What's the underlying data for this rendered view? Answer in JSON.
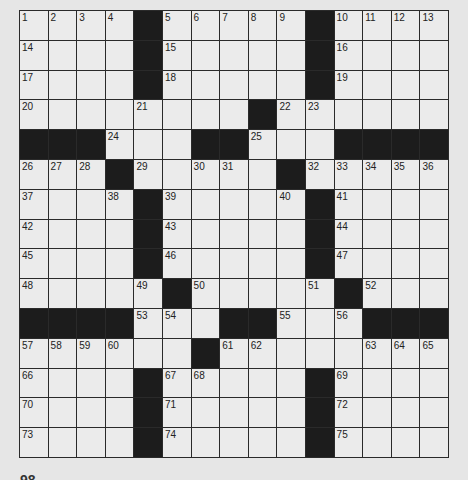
{
  "puzzle": {
    "rows": 15,
    "cols": 15,
    "colors": {
      "background": "#e6e6e6",
      "cell": "#ebebeb",
      "block": "#1c1c1c",
      "gridline": "#2a2a2a"
    },
    "layout": [
      "1.2.3.4.#.5.6.7.8.9.#.10.11.12.13",
      "14.o.o.o.#.15.o.o.o.o.#.16.o.o.o",
      "17.o.o.o.#.18.o.o.o.o.#.19.o.o.o",
      "20.o.o.o.21.o.o.o.#.22.23.o.o.o.o",
      "#.#.#.24.o.o.#.#.25.o.o.#.#.#.#",
      "26.27.28.#.29.o.30.31.o.#.32.33.34.35.36",
      "37.o.o.38.#.39.o.o.o.40.#.41.o.o.o",
      "42.o.o.o.#.43.o.o.o.o.#.44.o.o.o",
      "45.o.o.o.#.46.o.o.o.o.#.47.o.o.o",
      "48.o.o.o.49.#.50.o.o.o.51.#.52.o.o",
      "#.#.#.#.53.54.o.#.#.55.o.56.#.#.#",
      "57.58.59.60.o.o.#.61.62.o.o.o.63.64.65",
      "66.o.o.o.#.67.68.o.o.o.#.69.o.o.o",
      "70.o.o.o.#.71.o.o.o.o.#.72.o.o.o",
      "73.o.o.o.#.74.o.o.o.o.#.75.o.o.o"
    ]
  },
  "footer": {
    "page_number": "98"
  }
}
